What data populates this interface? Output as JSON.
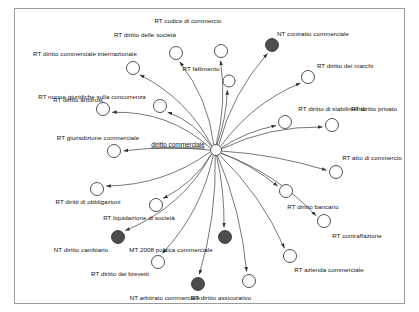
{
  "diagram": {
    "type": "radial-node-link-graph",
    "title_label": "diritto commerciale",
    "background_color": "#ffffff",
    "frame_color": "#9a9a9a",
    "edge_color": "#4a4a4a",
    "node_fill_light": "#ffffff",
    "node_fill_dark": "#4d4d4d",
    "node_stroke": "#333333",
    "center": {
      "x": 216,
      "y": 150,
      "r": 5.5,
      "label": "diritto commerciale",
      "fill": "#ffffff"
    },
    "nodes": [
      {
        "id": "n1",
        "label": "RT codice di commercio",
        "cx": 221,
        "cy": 51,
        "r": 6.5,
        "fill": "light",
        "lx": 188,
        "ly": 20
      },
      {
        "id": "n2",
        "label": "RT diritto delle società",
        "cx": 176,
        "cy": 53,
        "r": 6.5,
        "fill": "light",
        "lx": 145,
        "ly": 34
      },
      {
        "id": "n3",
        "label": "RT diritto commerciale internazionale",
        "cx": 133,
        "cy": 68,
        "r": 6.5,
        "fill": "light",
        "lx": 85,
        "ly": 53
      },
      {
        "id": "n4",
        "label": "RT fallimento",
        "cx": 229,
        "cy": 81,
        "r": 6.0,
        "fill": "light",
        "lx": 201,
        "ly": 68
      },
      {
        "id": "n5",
        "label": "NT contratto commerciale",
        "cx": 272,
        "cy": 45,
        "r": 6.5,
        "fill": "dark",
        "lx": 313,
        "ly": 33
      },
      {
        "id": "n6",
        "label": "RT diritto dei marchi",
        "cx": 308,
        "cy": 77,
        "r": 6.5,
        "fill": "light",
        "lx": 345,
        "ly": 65
      },
      {
        "id": "n7",
        "label": "RT norme giuridiche sulla concorrenza",
        "cx": 103,
        "cy": 109,
        "r": 6.5,
        "fill": "light",
        "lx": 92,
        "ly": 96
      },
      {
        "id": "n8",
        "label": "RT diritto antitrust",
        "cx": 160,
        "cy": 106,
        "r": 6.5,
        "fill": "light",
        "lx": 78,
        "ly": 99
      },
      {
        "id": "n9",
        "label": "RT diritto di stabilimento",
        "cx": 285,
        "cy": 122,
        "r": 6.5,
        "fill": "light",
        "lx": 332,
        "ly": 108
      },
      {
        "id": "n10",
        "label": "RT diritto privato",
        "cx": 332,
        "cy": 125,
        "r": 6.5,
        "fill": "light",
        "lx": 374,
        "ly": 108
      },
      {
        "id": "n11",
        "label": "RT giurisdizione commerciale",
        "cx": 114,
        "cy": 151,
        "r": 6.5,
        "fill": "light",
        "lx": 98,
        "ly": 137
      },
      {
        "id": "n12",
        "label": "RT atto di commercio",
        "cx": 336,
        "cy": 172,
        "r": 6.5,
        "fill": "light",
        "lx": 372,
        "ly": 157
      },
      {
        "id": "n13",
        "label": "RT diritti di obbligazioni",
        "cx": 97,
        "cy": 189,
        "r": 6.5,
        "fill": "light",
        "lx": 88,
        "ly": 201
      },
      {
        "id": "n14",
        "label": "RT diritto bancario",
        "cx": 286,
        "cy": 191,
        "r": 6.5,
        "fill": "light",
        "lx": 313,
        "ly": 206
      },
      {
        "id": "n15",
        "label": "RT liquidazione di società",
        "cx": 156,
        "cy": 205,
        "r": 6.5,
        "fill": "light",
        "lx": 139,
        "ly": 217
      },
      {
        "id": "n16",
        "label": "RT contraffazione",
        "cx": 324,
        "cy": 221,
        "r": 6.5,
        "fill": "light",
        "lx": 357,
        "ly": 235
      },
      {
        "id": "n17",
        "label": "NT diritto cambiario",
        "cx": 118,
        "cy": 237,
        "r": 6.5,
        "fill": "dark",
        "lx": 81,
        "ly": 249
      },
      {
        "id": "n18",
        "label": "MT 2008 politica commerciale",
        "cx": 225,
        "cy": 237,
        "r": 6.5,
        "fill": "dark",
        "lx": 171,
        "ly": 249
      },
      {
        "id": "n19",
        "label": "RT diritto dei brevetti",
        "cx": 158,
        "cy": 262,
        "r": 6.5,
        "fill": "light",
        "lx": 120,
        "ly": 273
      },
      {
        "id": "n20",
        "label": "RT azienda commerciale",
        "cx": 290,
        "cy": 256,
        "r": 6.5,
        "fill": "light",
        "lx": 329,
        "ly": 269
      },
      {
        "id": "n21",
        "label": "NT arbitrato commerciale",
        "cx": 198,
        "cy": 284,
        "r": 6.5,
        "fill": "dark",
        "lx": 165,
        "ly": 297
      },
      {
        "id": "n22",
        "label": "RT diritto assicurativo",
        "cx": 249,
        "cy": 281,
        "r": 6.5,
        "fill": "light",
        "lx": 221,
        "ly": 297
      }
    ],
    "edges": [
      {
        "from": "center",
        "to": "n1",
        "curve": 0.1
      },
      {
        "from": "center",
        "to": "n2",
        "curve": 0.14
      },
      {
        "from": "center",
        "to": "n3",
        "curve": 0.16
      },
      {
        "from": "center",
        "to": "n4",
        "curve": 0.08
      },
      {
        "from": "center",
        "to": "n5",
        "curve": -0.12
      },
      {
        "from": "center",
        "to": "n6",
        "curve": -0.14
      },
      {
        "from": "center",
        "to": "n7",
        "curve": 0.2
      },
      {
        "from": "center",
        "to": "n8",
        "curve": 0.16
      },
      {
        "from": "center",
        "to": "n9",
        "curve": -0.1
      },
      {
        "from": "center",
        "to": "n10",
        "curve": -0.12
      },
      {
        "from": "center",
        "to": "n11",
        "curve": 0.06
      },
      {
        "from": "center",
        "to": "n12",
        "curve": -0.06
      },
      {
        "from": "center",
        "to": "n13",
        "curve": -0.16
      },
      {
        "from": "center",
        "to": "n14",
        "curve": -0.08
      },
      {
        "from": "center",
        "to": "n15",
        "curve": -0.14
      },
      {
        "from": "center",
        "to": "n16",
        "curve": -0.12
      },
      {
        "from": "center",
        "to": "n17",
        "curve": -0.18
      },
      {
        "from": "center",
        "to": "n18",
        "curve": -0.06
      },
      {
        "from": "center",
        "to": "n19",
        "curve": -0.14
      },
      {
        "from": "center",
        "to": "n20",
        "curve": -0.1
      },
      {
        "from": "center",
        "to": "n21",
        "curve": -0.08
      },
      {
        "from": "center",
        "to": "n22",
        "curve": -0.08
      }
    ]
  }
}
